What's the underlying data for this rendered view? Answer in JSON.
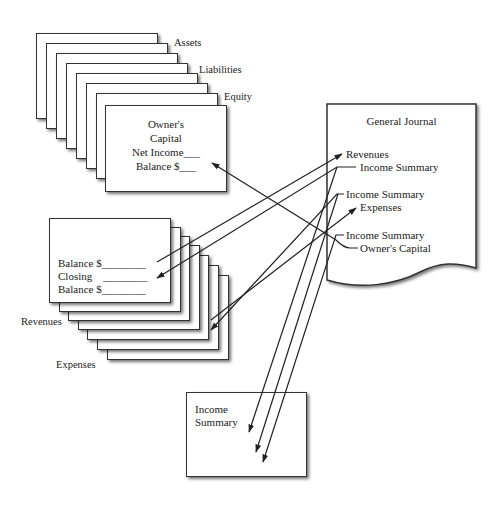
{
  "ledger_stack": {
    "labels": [
      "Assets",
      "Liabilities",
      "Equity"
    ],
    "front_card": {
      "title_line1": "Owner's",
      "title_line2": "Capital",
      "net_income": "Net Income___",
      "balance": "Balance $___"
    }
  },
  "temp_stack": {
    "labels": [
      "Revenues",
      "Expenses"
    ],
    "front_card": {
      "line1": "Balance $________",
      "line2": "Closing    ________",
      "line3": "Balance $________"
    }
  },
  "journal": {
    "title": "General Journal",
    "entries": [
      {
        "debit": "Revenues",
        "credit": "Income Summary"
      },
      {
        "debit": "Income Summary",
        "credit": "Expenses"
      },
      {
        "debit": "Income Summary",
        "credit": "Owner's Capital"
      }
    ]
  },
  "income_summary_box": {
    "line1": "Income",
    "line2": "Summary"
  }
}
